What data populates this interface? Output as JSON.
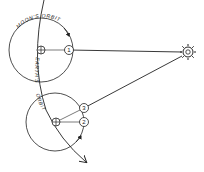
{
  "diagram": {
    "type": "astronomy-orbit-diagram",
    "labels": {
      "moons_orbit": "MOON'S ORBIT",
      "earths": "EARTH'S",
      "orbit": "ORBIT"
    },
    "bodies": {
      "sun": {
        "name": "sun-icon",
        "x": 188,
        "y": 52
      },
      "earth_top": {
        "name": "earth-icon",
        "x": 41,
        "y": 50
      },
      "earth_bottom": {
        "name": "earth-icon",
        "x": 56,
        "y": 122
      }
    },
    "moon_positions": [
      {
        "label": "1",
        "x": 69,
        "y": 50
      },
      {
        "label": "2",
        "x": 84,
        "y": 122
      },
      {
        "label": "3",
        "x": 84,
        "y": 108
      }
    ],
    "colors": {
      "ink": "#222222",
      "background": "#ffffff"
    }
  }
}
